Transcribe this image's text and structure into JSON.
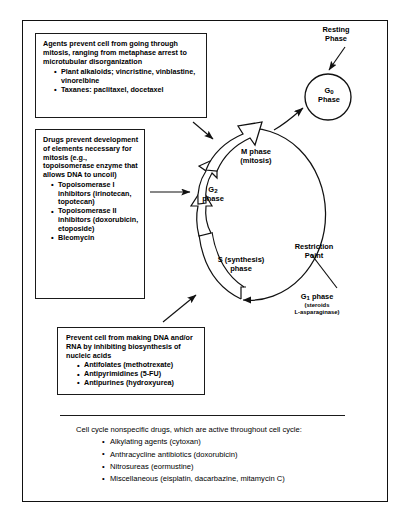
{
  "callouts": [
    {
      "id": "mitosis",
      "lead": "Agents prevent cell from going through mitosis, ranging from metaphase arrest to microtubular disorganization",
      "items": [
        "Plant alkaloids; vincristine, vinblastine, vinorelbine",
        "Taxanes: paclitaxel, docetaxel"
      ]
    },
    {
      "id": "topoisomerase",
      "lead": "Drugs prevent development of elements necessary for mitosis (e.g., topoisomerase enzyme that allows DNA to uncoil)",
      "items": [
        "Topoisomerase I inhibitors (irinotecan, topotecan)",
        "Topoisomerase II inhibitors (doxorubicin, etoposide)",
        "Bleomycin"
      ]
    },
    {
      "id": "dna",
      "lead": "Prevent cell from making DNA and/or RNA by inhibiting biosynthesis of nucleic acids",
      "items": [
        "Antifolates (methotrexate)",
        "Antipyrimidines (5-FU)",
        "Antipurines (hydroxyurea)"
      ]
    }
  ],
  "cycle_labels": {
    "resting_phase": "Resting\nPhase",
    "resting_phase_line1": "Resting",
    "resting_phase_line2": "Phase",
    "g0_line1": "G",
    "g0_sub": "0",
    "g0_line2": "Phase",
    "m_phase_line1": "M phase",
    "m_phase_line2": "(mitosis)",
    "g2_line1": "G",
    "g2_sub": "2",
    "g2_line2": "phase",
    "s_phase_line1": "S (synthesis)",
    "s_phase_line2": "phase",
    "restriction_line1": "Restriction",
    "restriction_line2": "Point",
    "g1_line1": "G",
    "g1_sub": "1",
    "g1_line1_tail": " phase",
    "g1_line2": "(steroids",
    "g1_line3": "L-asparaginase)"
  },
  "bottom": {
    "lead": "Cell cycle nonspecific drugs, which are active throughout cell cycle:",
    "items": [
      "Alkylating agents (cytoxan)",
      "Anthracycline antibiotics (doxorubicin)",
      "Nitrosureas (eormustine)",
      "Miscellaneous (eisplatin, dacarbazine, mitamycin C)"
    ]
  },
  "colors": {
    "ink": "#111111",
    "background": "#ffffff"
  }
}
